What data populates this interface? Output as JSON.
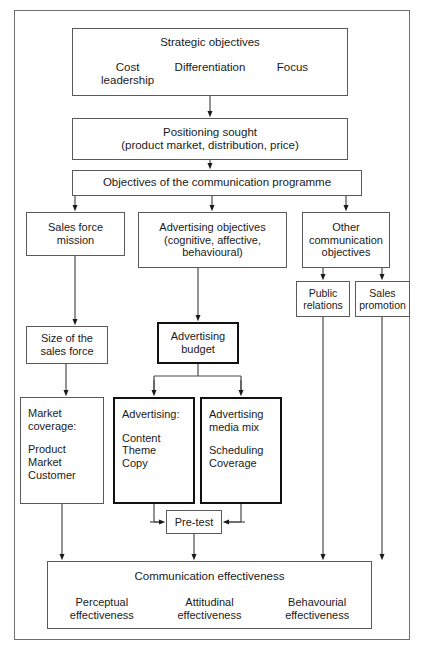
{
  "diagram": {
    "frame_color": "#6e6e6e",
    "accent_color": "#111111",
    "nodes": {
      "strategic": {
        "heading": "Strategic objectives",
        "columns": [
          "Cost\nleadership",
          "Differentiation",
          "Focus"
        ],
        "col_left_line1": "Cost",
        "col_left_line2": "leadership",
        "col_mid": "Differentiation",
        "col_right": "Focus"
      },
      "positioning": {
        "line1": "Positioning sought",
        "line2": "(product market, distribution, price)"
      },
      "objectives": {
        "label": "Objectives of the communication programme"
      },
      "sales_force_mission": {
        "line1": "Sales force",
        "line2": "mission"
      },
      "advertising_objectives": {
        "line1": "Advertising objectives",
        "line2": "(cognitive, affective,",
        "line3": "behavioural)"
      },
      "other_communication_objectives": {
        "line1": "Other",
        "line2": "communication",
        "line3": "objectives"
      },
      "public_relations": {
        "line1": "Public",
        "line2": "relations"
      },
      "sales_promotion": {
        "line1": "Sales",
        "line2": "promotion"
      },
      "size_sales_force": {
        "line1": "Size of the",
        "line2": "sales force"
      },
      "advertising_budget": {
        "line1": "Advertising",
        "line2": "budget"
      },
      "market_coverage": {
        "line1": "Market",
        "line2": "coverage:",
        "line3": "Product",
        "line4": "Market",
        "line5": "Customer"
      },
      "advertising_content": {
        "line1": "Advertising:",
        "line2": "Content",
        "line3": "Theme",
        "line4": "Copy"
      },
      "advertising_media_mix": {
        "line1": "Advertising",
        "line2": "media mix",
        "line3": "Scheduling",
        "line4": "Coverage"
      },
      "pre_test": {
        "label": "Pre-test"
      },
      "communication_effectiveness": {
        "heading": "Communication effectiveness",
        "col_left_line1": "Perceptual",
        "col_left_line2": "effectiveness",
        "col_mid_line1": "Attitudinal",
        "col_mid_line2": "effectiveness",
        "col_right_line1": "Behavourial",
        "col_right_line2": "effectiveness"
      }
    }
  }
}
